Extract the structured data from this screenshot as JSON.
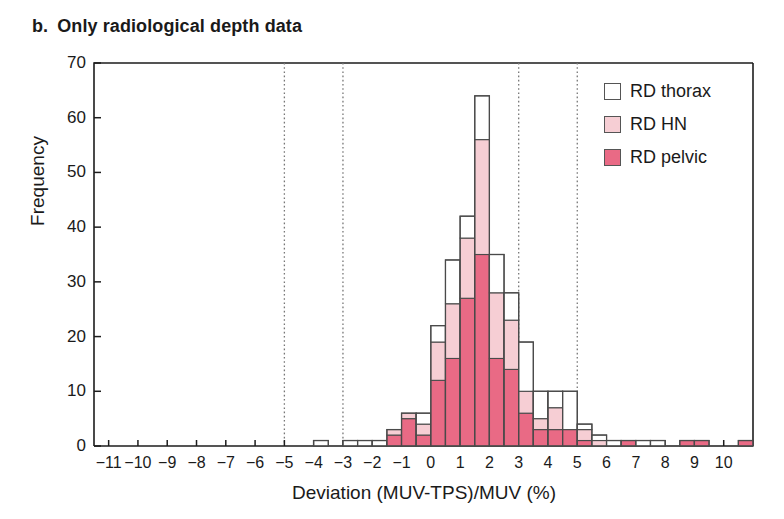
{
  "panel": {
    "label": "b.",
    "title": "Only radiological depth data"
  },
  "legend": {
    "position": "top-right",
    "items": [
      {
        "label": "RD thorax",
        "color": "#ffffff",
        "name": "rd-thorax"
      },
      {
        "label": "RD HN",
        "color": "#f6ced4",
        "name": "rd-hn"
      },
      {
        "label": "RD pelvic",
        "color": "#e96a85",
        "name": "rd-pelvic"
      }
    ]
  },
  "chart_data": {
    "type": "bar",
    "subtype": "stacked-histogram",
    "title": "Only radiological depth data",
    "xlabel": "Deviation (MUV-TPS)/MUV (%)",
    "ylabel": "Frequency",
    "xlim": [
      -11.5,
      11.0
    ],
    "ylim": [
      0,
      70
    ],
    "xticks": [
      -11,
      -10,
      -9,
      -8,
      -7,
      -6,
      -5,
      -4,
      -3,
      -2,
      -1,
      0,
      1,
      2,
      3,
      4,
      5,
      6,
      7,
      8,
      9,
      10
    ],
    "yticks": [
      0,
      10,
      20,
      30,
      40,
      50,
      60,
      70
    ],
    "grid": false,
    "bin_width": 0.5,
    "reference_lines": [
      -5,
      -3,
      3,
      5
    ],
    "reference_line_style": "dotted",
    "series": [
      {
        "name": "RD pelvic",
        "color": "#e96a85"
      },
      {
        "name": "RD HN",
        "color": "#f6ced4"
      },
      {
        "name": "RD thorax",
        "color": "#ffffff"
      }
    ],
    "bins": [
      {
        "x0": -4.0,
        "x1": -3.5,
        "pelvic": 0,
        "hn": 0,
        "thorax": 1,
        "total": 1
      },
      {
        "x0": -3.0,
        "x1": -2.5,
        "pelvic": 0,
        "hn": 0,
        "thorax": 1,
        "total": 1
      },
      {
        "x0": -2.5,
        "x1": -2.0,
        "pelvic": 0,
        "hn": 0,
        "thorax": 1,
        "total": 1
      },
      {
        "x0": -2.0,
        "x1": -1.5,
        "pelvic": 0,
        "hn": 0,
        "thorax": 1,
        "total": 1
      },
      {
        "x0": -1.5,
        "x1": -1.0,
        "pelvic": 2,
        "hn": 1,
        "thorax": 0,
        "total": 3
      },
      {
        "x0": -1.0,
        "x1": -0.5,
        "pelvic": 5,
        "hn": 1,
        "thorax": 0,
        "total": 6
      },
      {
        "x0": -0.5,
        "x1": 0.0,
        "pelvic": 2,
        "hn": 2,
        "thorax": 2,
        "total": 6
      },
      {
        "x0": 0.0,
        "x1": 0.5,
        "pelvic": 12,
        "hn": 7,
        "thorax": 3,
        "total": 22
      },
      {
        "x0": 0.5,
        "x1": 1.0,
        "pelvic": 16,
        "hn": 10,
        "thorax": 8,
        "total": 34
      },
      {
        "x0": 1.0,
        "x1": 1.5,
        "pelvic": 27,
        "hn": 11,
        "thorax": 4,
        "total": 42
      },
      {
        "x0": 1.5,
        "x1": 2.0,
        "pelvic": 35,
        "hn": 21,
        "thorax": 8,
        "total": 64
      },
      {
        "x0": 2.0,
        "x1": 2.5,
        "pelvic": 16,
        "hn": 12,
        "thorax": 7,
        "total": 35
      },
      {
        "x0": 2.5,
        "x1": 3.0,
        "pelvic": 14,
        "hn": 9,
        "thorax": 5,
        "total": 28
      },
      {
        "x0": 3.0,
        "x1": 3.5,
        "pelvic": 6,
        "hn": 4,
        "thorax": 9,
        "total": 19
      },
      {
        "x0": 3.5,
        "x1": 4.0,
        "pelvic": 3,
        "hn": 2,
        "thorax": 5,
        "total": 10
      },
      {
        "x0": 4.0,
        "x1": 4.5,
        "pelvic": 3,
        "hn": 4,
        "thorax": 3,
        "total": 10
      },
      {
        "x0": 4.5,
        "x1": 5.0,
        "pelvic": 3,
        "hn": 0,
        "thorax": 7,
        "total": 10
      },
      {
        "x0": 5.0,
        "x1": 5.5,
        "pelvic": 1,
        "hn": 2,
        "thorax": 1,
        "total": 4
      },
      {
        "x0": 5.5,
        "x1": 6.0,
        "pelvic": 0,
        "hn": 1,
        "thorax": 1,
        "total": 2
      },
      {
        "x0": 6.0,
        "x1": 6.5,
        "pelvic": 0,
        "hn": 0,
        "thorax": 1,
        "total": 1
      },
      {
        "x0": 6.5,
        "x1": 7.0,
        "pelvic": 1,
        "hn": 0,
        "thorax": 0,
        "total": 1
      },
      {
        "x0": 7.0,
        "x1": 7.5,
        "pelvic": 0,
        "hn": 0,
        "thorax": 1,
        "total": 1
      },
      {
        "x0": 7.5,
        "x1": 8.0,
        "pelvic": 0,
        "hn": 0,
        "thorax": 1,
        "total": 1
      },
      {
        "x0": 8.5,
        "x1": 9.0,
        "pelvic": 1,
        "hn": 0,
        "thorax": 0,
        "total": 1
      },
      {
        "x0": 9.0,
        "x1": 9.5,
        "pelvic": 1,
        "hn": 0,
        "thorax": 0,
        "total": 1
      },
      {
        "x0": 10.5,
        "x1": 11.0,
        "pelvic": 1,
        "hn": 0,
        "thorax": 0,
        "total": 1
      }
    ]
  },
  "axes": {
    "x_title": "Deviation (MUV-TPS)/MUV (%)",
    "y_title": "Frequency",
    "x_tick_labels": [
      "−11",
      "−10",
      "−9",
      "−8",
      "−7",
      "−6",
      "−5",
      "−4",
      "−3",
      "−2",
      "−1",
      "0",
      "1",
      "2",
      "3",
      "4",
      "5",
      "6",
      "7",
      "8",
      "9",
      "10"
    ],
    "y_tick_labels": [
      "0",
      "10",
      "20",
      "30",
      "40",
      "50",
      "60",
      "70"
    ]
  },
  "colors": {
    "pelvic": "#e96a85",
    "hn": "#f6ced4",
    "thorax": "#ffffff",
    "outline": "#4a4a4a",
    "axis": "#1d1d1d",
    "refline": "#777777"
  }
}
